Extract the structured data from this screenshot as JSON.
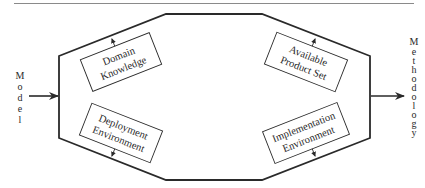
{
  "diagram": {
    "input_label": "Model",
    "output_label": "Methodology",
    "boxes": {
      "top_left": {
        "line1": "Domain",
        "line2": "Knowledge"
      },
      "top_right": {
        "line1": "Available",
        "line2": "Product Set"
      },
      "bottom_left": {
        "line1": "Deployment",
        "line2": "Environment"
      },
      "bottom_right": {
        "line1": "Implementation",
        "line2": "Environment"
      }
    },
    "input_letters": [
      "M",
      "o",
      "d",
      "e",
      "l"
    ],
    "output_letters": [
      "M",
      "e",
      "t",
      "h",
      "o",
      "d",
      "o",
      "l",
      "o",
      "g",
      "y"
    ],
    "colors": {
      "stroke": "#2a2a2a",
      "rule": "#8a8a8a",
      "background": "#ffffff"
    }
  }
}
